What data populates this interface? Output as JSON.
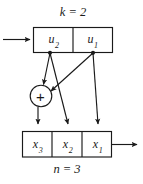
{
  "figure": {
    "title_top": "k = 2",
    "title_bottom": "n = 3",
    "stroke_color": "#1a1a1a",
    "fill_color": "#ffffff",
    "adder_symbol": "+",
    "top_register": {
      "name": "u-register",
      "cells": [
        {
          "id": "u2",
          "base": "u",
          "sub": "2"
        },
        {
          "id": "u1",
          "base": "u",
          "sub": "1"
        }
      ]
    },
    "bottom_register": {
      "name": "x-register",
      "cells": [
        {
          "id": "x3",
          "base": "x",
          "sub": "3"
        },
        {
          "id": "x2",
          "base": "x",
          "sub": "2"
        },
        {
          "id": "x1",
          "base": "x",
          "sub": "1"
        }
      ]
    }
  }
}
